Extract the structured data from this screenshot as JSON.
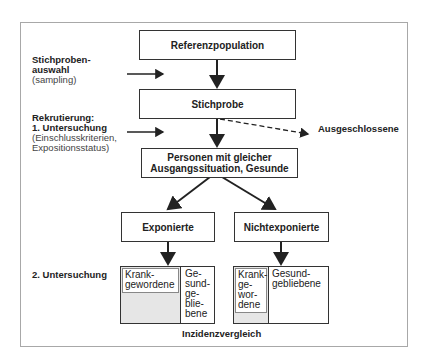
{
  "diagram": {
    "boxes": {
      "reference_population": "Referenzpopulation",
      "sample": "Stichprobe",
      "baseline": "Personen mit gleicher\nAusgangssituation, Gesunde",
      "exposed": "Exponierte",
      "unexposed": "Nichtexponierte"
    },
    "side_labels": {
      "sampling_title": "Stichproben-\nauswahl",
      "sampling_sub": "(sampling)",
      "recruitment_title": "Rekrutierung:\n1. Untersuchung",
      "recruitment_sub": "(Einschlusskriterien,\nExpositionsstatus)",
      "second_exam": "2. Untersuchung"
    },
    "excluded": "Ausgeschlossene",
    "outcomes": {
      "exposed_sick": "Krank-\ngewordene",
      "exposed_healthy": "Ge-\nsund-\nge-\nblie-\nbene",
      "unexposed_sick": "Krank-\nge-\nwor-\ndene",
      "unexposed_healthy": "Gesund-\ngebliebene"
    },
    "comparison": "Inzidenzvergleich"
  }
}
